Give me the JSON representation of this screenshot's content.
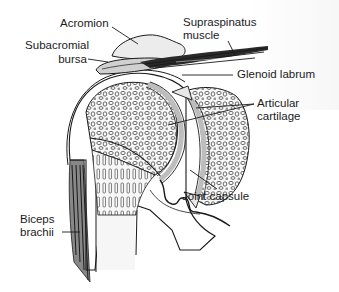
{
  "diagram": {
    "colors": {
      "line": "#1a1a1a",
      "bone_fill": "#f2f2f2",
      "cartilage": "#d4d4d4",
      "bursa": "#c8c8c8",
      "muscle": "#3a3a3a"
    },
    "labels": {
      "acromion": "Acromion",
      "subacromial_bursa_1": "Subacromial",
      "subacromial_bursa_2": "bursa",
      "supraspinatus_1": "Supraspinatus",
      "supraspinatus_2": "muscle",
      "glenoid_labrum": "Glenoid labrum",
      "articular_cartilage_1": "Articular",
      "articular_cartilage_2": "cartilage",
      "joint_capsule": "Joint capsule",
      "biceps_1": "Biceps",
      "biceps_2": "brachii"
    }
  }
}
